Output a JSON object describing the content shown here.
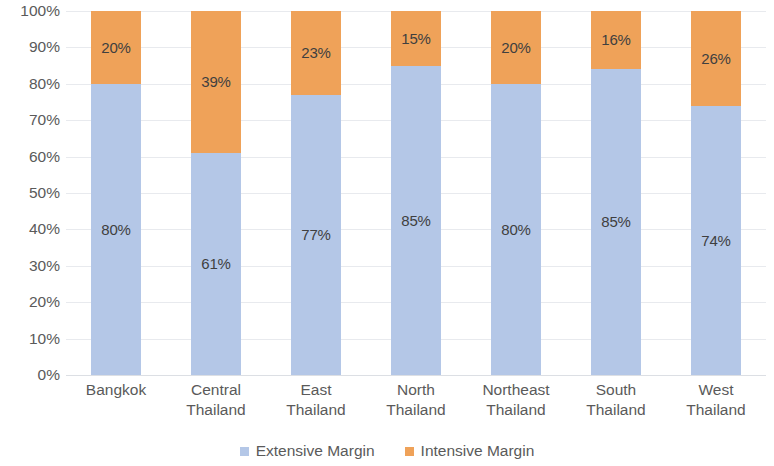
{
  "chart_data": {
    "type": "bar",
    "stacked": true,
    "normalized_percent": true,
    "title": "",
    "subtitle": "",
    "xlabel": "",
    "ylabel": "",
    "ylim": [
      0,
      100
    ],
    "y_ticks": [
      "0%",
      "10%",
      "20%",
      "30%",
      "40%",
      "50%",
      "60%",
      "70%",
      "80%",
      "90%",
      "100%"
    ],
    "y_tick_values": [
      0,
      10,
      20,
      30,
      40,
      50,
      60,
      70,
      80,
      90,
      100
    ],
    "grid": true,
    "grid_axis": "y",
    "legend_position": "bottom",
    "categories": [
      "Bangkok",
      "Central Thailand",
      "East Thailand",
      "North Thailand",
      "Northeast Thailand",
      "South Thailand",
      "West Thailand"
    ],
    "category_lines": [
      [
        "Bangkok",
        ""
      ],
      [
        "Central",
        "Thailand"
      ],
      [
        "East",
        "Thailand"
      ],
      [
        "North",
        "Thailand"
      ],
      [
        "Northeast",
        "Thailand"
      ],
      [
        "South",
        "Thailand"
      ],
      [
        "West",
        "Thailand"
      ]
    ],
    "series": [
      {
        "name": "Extensive Margin",
        "color": "#b4c7e7",
        "values": [
          80,
          61,
          77,
          85,
          80,
          85,
          74
        ],
        "labels": [
          "80%",
          "61%",
          "77%",
          "85%",
          "80%",
          "85%",
          "74%"
        ]
      },
      {
        "name": "Intensive Margin",
        "color": "#efa259",
        "values": [
          20,
          39,
          23,
          15,
          20,
          16,
          26
        ],
        "labels": [
          "20%",
          "39%",
          "23%",
          "15%",
          "20%",
          "16%",
          "26%"
        ]
      }
    ]
  },
  "legend": {
    "items": [
      {
        "label": "Extensive Margin",
        "color": "#b4c7e7"
      },
      {
        "label": "Intensive Margin",
        "color": "#efa259"
      }
    ]
  },
  "colors": {
    "extensive": "#b4c7e7",
    "intensive": "#efa259",
    "text": "#5a5a5a",
    "label_text": "#3f3f3f",
    "gridline": "#e8eaee",
    "background": "#ffffff"
  }
}
